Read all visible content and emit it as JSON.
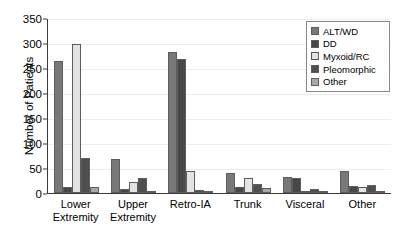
{
  "chart_data": {
    "type": "bar",
    "title": "",
    "xlabel": "",
    "ylabel": "Number of Patients",
    "ylim": [
      0,
      350
    ],
    "yticks": [
      0,
      50,
      100,
      150,
      200,
      250,
      300,
      350
    ],
    "grid": true,
    "legend_position": "top-right",
    "categories": [
      "Lower Extremity",
      "Upper Extremity",
      "Retro-IA",
      "Trunk",
      "Visceral",
      "Other"
    ],
    "series": [
      {
        "name": "ALT/WD",
        "color": "#787878",
        "values": [
          265,
          68,
          283,
          40,
          33,
          45
        ]
      },
      {
        "name": "DD",
        "color": "#474747",
        "values": [
          13,
          8,
          268,
          13,
          31,
          15
        ]
      },
      {
        "name": "Myxoid/RC",
        "color": "#e3e3e3",
        "values": [
          298,
          22,
          45,
          30,
          5,
          13
        ]
      },
      {
        "name": "Pleomorphic",
        "color": "#4f4f4f",
        "values": [
          70,
          30,
          6,
          18,
          9,
          17
        ]
      },
      {
        "name": "Other",
        "color": "#a8a8a8",
        "values": [
          12,
          5,
          4,
          11,
          3,
          5
        ]
      }
    ]
  },
  "legend": {
    "items": [
      {
        "label": "ALT/WD"
      },
      {
        "label": "DD"
      },
      {
        "label": "Myxoid/RC"
      },
      {
        "label": "Pleomorphic"
      },
      {
        "label": "Other"
      }
    ]
  },
  "axis": {
    "y_title": "Number of Patients"
  }
}
